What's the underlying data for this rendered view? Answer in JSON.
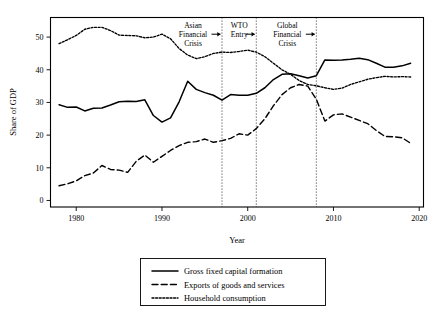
{
  "chart_data": {
    "type": "line",
    "title": "",
    "xlabel": "Year",
    "ylabel": "Share of GDP",
    "xlim": [
      1977,
      2020.5
    ],
    "ylim": [
      -2,
      56
    ],
    "xticks": [
      1980,
      1990,
      2000,
      2010,
      2020
    ],
    "yticks": [
      0,
      10,
      20,
      30,
      40,
      50
    ],
    "grid": false,
    "legend_position": "below-axis-center",
    "x": [
      1978,
      1979,
      1980,
      1981,
      1982,
      1983,
      1984,
      1985,
      1986,
      1987,
      1988,
      1989,
      1990,
      1991,
      1992,
      1993,
      1994,
      1995,
      1996,
      1997,
      1998,
      1999,
      2000,
      2001,
      2002,
      2003,
      2004,
      2005,
      2006,
      2007,
      2008,
      2009,
      2010,
      2011,
      2012,
      2013,
      2014,
      2015,
      2016,
      2017,
      2018,
      2019
    ],
    "series": [
      {
        "name": "Gross fixed capital formation",
        "style": "solid",
        "values": [
          29.3,
          28.5,
          28.6,
          27.4,
          28.2,
          28.3,
          29.2,
          30.2,
          30.4,
          30.3,
          30.8,
          26.0,
          24.0,
          25.3,
          30.2,
          36.5,
          34.0,
          33.0,
          32.2,
          30.7,
          32.4,
          32.2,
          32.2,
          32.8,
          34.5,
          37.0,
          38.6,
          38.8,
          38.2,
          37.5,
          38.2,
          43.0,
          42.9,
          43.0,
          43.2,
          43.5,
          43.1,
          42.0,
          40.8,
          40.8,
          41.2,
          42.0
        ]
      },
      {
        "name": "Exports of goods and services",
        "style": "dashed",
        "values": [
          4.5,
          5.1,
          6.0,
          7.6,
          8.4,
          10.7,
          9.5,
          9.3,
          8.6,
          12.0,
          13.9,
          11.7,
          13.5,
          15.3,
          16.8,
          17.8,
          18.0,
          18.8,
          17.8,
          18.3,
          19.0,
          20.4,
          20.0,
          22.0,
          25.0,
          29.0,
          32.4,
          34.5,
          35.5,
          35.0,
          31.0,
          24.3,
          26.2,
          26.5,
          25.5,
          24.5,
          23.5,
          21.4,
          19.6,
          19.5,
          19.2,
          17.5
        ]
      },
      {
        "name": "Household consumption",
        "style": "dotted",
        "values": [
          48.0,
          49.2,
          50.5,
          52.4,
          53.0,
          53.0,
          52.0,
          50.6,
          50.5,
          50.4,
          49.8,
          50.0,
          50.9,
          49.5,
          46.5,
          44.5,
          43.4,
          44.0,
          45.0,
          45.4,
          45.3,
          45.6,
          46.0,
          45.4,
          44.0,
          42.0,
          40.0,
          38.6,
          36.7,
          35.5,
          35.1,
          34.5,
          34.0,
          34.4,
          35.5,
          36.3,
          37.1,
          37.6,
          38.0,
          37.8,
          37.9,
          37.8
        ]
      }
    ],
    "annotations": [
      {
        "label": "Asian Financial Crisis",
        "lines": [
          "Asian",
          "Financial",
          "Crisis"
        ],
        "event_year": 1997,
        "arrow": "right"
      },
      {
        "label": "WTO Entry",
        "lines": [
          "WTO",
          "Entry"
        ],
        "event_year": 2001,
        "arrow": "right"
      },
      {
        "label": "Global Financial Crisis",
        "lines": [
          "Global",
          "Financial",
          "Crisis"
        ],
        "event_year": 2008,
        "arrow": "right"
      }
    ]
  },
  "legend": {
    "entries": [
      {
        "label": "Gross fixed capital formation",
        "style": "solid"
      },
      {
        "label": "Exports of goods and services",
        "style": "dashed"
      },
      {
        "label": "Household consumption",
        "style": "dotted"
      }
    ]
  },
  "colors": {
    "line": "#000000",
    "background": "#ffffff",
    "frame": "#000000"
  }
}
